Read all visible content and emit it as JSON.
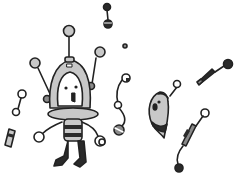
{
  "scene": {
    "description": "Black-and-white cartoon illustration of a small robot with antennae surrounded by floating bead-and-string creatures",
    "colors": {
      "background": "#ffffff",
      "outline": "#222222",
      "light_gray": "#c8c8c8",
      "mid_gray": "#8a8a8a",
      "dark": "#2a2a2a"
    },
    "elements": [
      {
        "name": "robot",
        "parts": [
          "dome-head-with-face",
          "three-antennae",
          "saucer-collar",
          "striped-body",
          "two-arms",
          "two-legs"
        ]
      },
      {
        "name": "ghost-creature",
        "parts": [
          "teardrop-body",
          "face",
          "striped-tail",
          "antenna-bead"
        ]
      },
      {
        "name": "floating-beads",
        "count": 7
      }
    ]
  }
}
